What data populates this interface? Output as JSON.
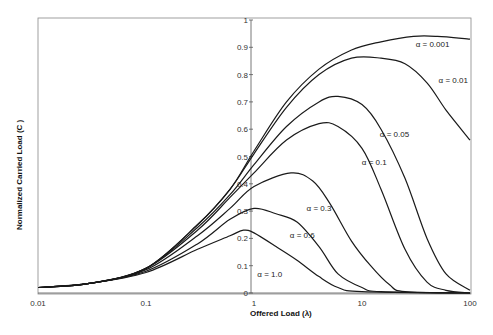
{
  "chart_data": {
    "type": "line",
    "title": "",
    "xlabel": "Offered Load (λ)",
    "ylabel": "Normalized Carried Load (C )",
    "xscale": "log",
    "xlim": [
      0.01,
      100
    ],
    "ylim": [
      0,
      1
    ],
    "x_ticks": [
      "0.01",
      "0.1",
      "1",
      "10",
      "100"
    ],
    "y_ticks": [
      "0",
      "0.1",
      "0.2",
      "0.3",
      "0.4",
      "0.5",
      "0.6",
      "0.7",
      "0.8",
      "0.9",
      "1"
    ],
    "grid": false,
    "legend": "inline labels",
    "series": [
      {
        "name": "α = 0.001",
        "points": [
          [
            0.01,
            0.02
          ],
          [
            0.03,
            0.035
          ],
          [
            0.1,
            0.09
          ],
          [
            0.3,
            0.25
          ],
          [
            0.6,
            0.38
          ],
          [
            1,
            0.52
          ],
          [
            2,
            0.7
          ],
          [
            4,
            0.82
          ],
          [
            8,
            0.89
          ],
          [
            15,
            0.92
          ],
          [
            30,
            0.94
          ],
          [
            50,
            0.94
          ],
          [
            100,
            0.93
          ]
        ]
      },
      {
        "name": "α = 0.01",
        "points": [
          [
            0.01,
            0.02
          ],
          [
            0.03,
            0.035
          ],
          [
            0.1,
            0.09
          ],
          [
            0.3,
            0.25
          ],
          [
            0.6,
            0.38
          ],
          [
            1,
            0.51
          ],
          [
            2,
            0.68
          ],
          [
            4,
            0.8
          ],
          [
            8,
            0.86
          ],
          [
            15,
            0.86
          ],
          [
            25,
            0.84
          ],
          [
            40,
            0.77
          ],
          [
            60,
            0.67
          ],
          [
            100,
            0.56
          ]
        ]
      },
      {
        "name": "α = 0.05",
        "points": [
          [
            0.01,
            0.02
          ],
          [
            0.03,
            0.035
          ],
          [
            0.1,
            0.09
          ],
          [
            0.3,
            0.24
          ],
          [
            0.6,
            0.36
          ],
          [
            1,
            0.47
          ],
          [
            2,
            0.61
          ],
          [
            4,
            0.7
          ],
          [
            6,
            0.72
          ],
          [
            10,
            0.69
          ],
          [
            15,
            0.6
          ],
          [
            25,
            0.42
          ],
          [
            40,
            0.2
          ],
          [
            60,
            0.07
          ],
          [
            100,
            0.01
          ]
        ]
      },
      {
        "name": "α = 0.1",
        "points": [
          [
            0.01,
            0.02
          ],
          [
            0.03,
            0.035
          ],
          [
            0.1,
            0.09
          ],
          [
            0.3,
            0.23
          ],
          [
            0.6,
            0.35
          ],
          [
            1,
            0.44
          ],
          [
            2,
            0.56
          ],
          [
            4,
            0.62
          ],
          [
            6,
            0.61
          ],
          [
            10,
            0.53
          ],
          [
            15,
            0.38
          ],
          [
            25,
            0.16
          ],
          [
            40,
            0.04
          ],
          [
            60,
            0.01
          ],
          [
            100,
            0.0
          ]
        ]
      },
      {
        "name": "α = 0.3",
        "points": [
          [
            0.01,
            0.02
          ],
          [
            0.03,
            0.035
          ],
          [
            0.1,
            0.085
          ],
          [
            0.3,
            0.21
          ],
          [
            0.6,
            0.31
          ],
          [
            1,
            0.39
          ],
          [
            2.2,
            0.44
          ],
          [
            3.5,
            0.41
          ],
          [
            5,
            0.33
          ],
          [
            8,
            0.19
          ],
          [
            12,
            0.1
          ],
          [
            18,
            0.03
          ],
          [
            25,
            0.005
          ],
          [
            100,
            0.0
          ]
        ]
      },
      {
        "name": "α = 0.6",
        "points": [
          [
            0.01,
            0.02
          ],
          [
            0.03,
            0.035
          ],
          [
            0.1,
            0.08
          ],
          [
            0.3,
            0.18
          ],
          [
            0.6,
            0.27
          ],
          [
            1,
            0.31
          ],
          [
            1.6,
            0.29
          ],
          [
            2.5,
            0.26
          ],
          [
            4,
            0.17
          ],
          [
            6,
            0.07
          ],
          [
            10,
            0.02
          ],
          [
            15,
            0.005
          ],
          [
            100,
            0.0
          ]
        ]
      },
      {
        "name": "α = 1.0",
        "points": [
          [
            0.01,
            0.02
          ],
          [
            0.03,
            0.035
          ],
          [
            0.1,
            0.075
          ],
          [
            0.3,
            0.16
          ],
          [
            0.6,
            0.21
          ],
          [
            0.8,
            0.23
          ],
          [
            1,
            0.22
          ],
          [
            1.6,
            0.17
          ],
          [
            2.5,
            0.12
          ],
          [
            4,
            0.06
          ],
          [
            6,
            0.02
          ],
          [
            10,
            0.005
          ],
          [
            100,
            0.0
          ]
        ]
      }
    ],
    "annotations": [
      {
        "text": "α = 0.001",
        "x": 45,
        "y": 0.9
      },
      {
        "text": "α = 0.01",
        "x": 70,
        "y": 0.77
      },
      {
        "text": "α = 0.05",
        "x": 20,
        "y": 0.57
      },
      {
        "text": "α = 0.1",
        "x": 13,
        "y": 0.47
      },
      {
        "text": "α = 0.3",
        "x": 4,
        "y": 0.3
      },
      {
        "text": "α = 0.6",
        "x": 2.8,
        "y": 0.2
      },
      {
        "text": "α = 1.0",
        "x": 1.4,
        "y": 0.06
      }
    ]
  },
  "labels": {
    "xlabel": "Offered Load (λ)",
    "ylabel": "Normalized Carried Load (C )"
  }
}
